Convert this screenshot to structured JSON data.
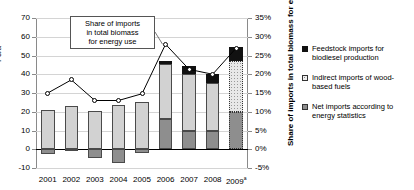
{
  "chart_data": {
    "type": "bar",
    "title": "",
    "categories": [
      "2001",
      "2002",
      "2003",
      "2004",
      "2005",
      "2006",
      "2007",
      "2008",
      "2009"
    ],
    "category_labels": [
      "2001",
      "2002",
      "2003",
      "2004",
      "2005",
      "2006",
      "2007",
      "2008",
      "2009a"
    ],
    "xlabel": "",
    "ylabel": "PJ/a",
    "ylim": [
      -10,
      70
    ],
    "yticks": [
      -10,
      0,
      10,
      20,
      30,
      40,
      50,
      60,
      70
    ],
    "ytick_labels": [
      "-10",
      "0",
      "10",
      "20",
      "30",
      "40",
      "50",
      "60",
      "70"
    ],
    "y2label": "Share of imports in total biomass for energy use",
    "y2lim": [
      -5,
      35
    ],
    "y2ticks": [
      -5,
      0,
      5,
      10,
      15,
      20,
      25,
      30,
      35
    ],
    "y2tick_labels": [
      "-5%",
      "0%",
      "5%",
      "10%",
      "15%",
      "20%",
      "25%",
      "30%",
      "35%"
    ],
    "grid": true,
    "legend_position": "right",
    "stacked": true,
    "series": [
      {
        "name": "Net imports according to energy statistics",
        "key": "net",
        "color": "#8e8e8e",
        "values": [
          -2.5,
          -1.0,
          -4.5,
          -7.5,
          -2.0,
          16.3,
          10.0,
          9.6,
          20.0
        ]
      },
      {
        "name": "Indirect imports of wood-based fuels",
        "key": "indirect",
        "color": "#d2d2d2",
        "values": [
          21.0,
          23.0,
          20.3,
          23.6,
          25.0,
          29.0,
          30.0,
          25.6,
          27.0
        ]
      },
      {
        "name": "Feedstock imports for biodiesel production",
        "key": "feed",
        "color": "#111111",
        "values": [
          0,
          0,
          0,
          0,
          0,
          1.7,
          4.5,
          4.8,
          7.6
        ]
      }
    ],
    "line_series": {
      "name": "Share of imports in total biomass for energy use",
      "marker": "open-circle",
      "color": "#000000",
      "unit": "%",
      "values": [
        15.0,
        18.5,
        13.0,
        13.0,
        14.8,
        28.0,
        21.3,
        20.0,
        27.0
      ]
    },
    "annotation": {
      "text_lines": [
        "Share of imports",
        "in total biomass",
        "for energy use"
      ]
    },
    "footnote_marker": "a",
    "projection_year": "2009"
  },
  "legend": {
    "items": [
      {
        "label_lines": [
          "Feedstock imports for",
          "biodiesel production"
        ],
        "swatch": "black-square"
      },
      {
        "label_lines": [
          "Indirect imports of wood-",
          "based fuels"
        ],
        "swatch": "dotted-square"
      },
      {
        "label_lines": [
          "Net imports according to",
          "energy statistics"
        ],
        "swatch": "gray-square"
      }
    ]
  }
}
